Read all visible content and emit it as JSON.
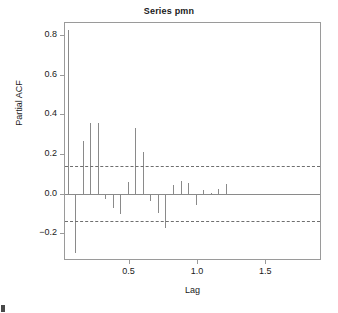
{
  "chart_data": {
    "type": "bar",
    "title": "Series pmn",
    "subtitle": "",
    "xlabel": "Lag",
    "ylabel": "Partial ACF",
    "xlim": [
      0.035,
      1.9
    ],
    "ylim": [
      -0.33,
      0.86
    ],
    "xticks": [
      0.5,
      1.0,
      1.5
    ],
    "xtick_labels": [
      "0.5",
      "1.0",
      "1.5"
    ],
    "yticks": [
      0.8,
      0.6,
      0.4,
      0.2,
      0.0,
      -0.2
    ],
    "ytick_labels": [
      "0.8",
      "0.6",
      "0.4",
      "0.2",
      "0.0",
      "−0.2"
    ],
    "grid": false,
    "legend": null,
    "confidence_band": [
      0.14,
      -0.14
    ],
    "confidence_style": "dashed",
    "x": [
      0.055,
      0.11,
      0.165,
      0.22,
      0.275,
      0.33,
      0.385,
      0.44,
      0.495,
      0.55,
      0.605,
      0.66,
      0.715,
      0.77,
      0.825,
      0.88,
      0.935,
      0.99,
      1.045,
      1.1,
      1.155,
      1.21,
      1.265,
      1.32,
      1.375,
      1.43,
      1.485,
      1.54,
      1.595,
      1.65,
      1.705,
      1.76,
      1.815,
      1.87
    ],
    "values": [
      0.825,
      -0.3,
      0.265,
      0.355,
      0.355,
      -0.03,
      -0.075,
      -0.105,
      0.06,
      0.33,
      0.21,
      -0.04,
      -0.1,
      -0.175,
      0.045,
      0.065,
      0.055,
      -0.06,
      0.02,
      0.005,
      0.025,
      0.05,
      0.0,
      0.0,
      0.0,
      0.0,
      0.0,
      0.0,
      0.0,
      0.0,
      0.0,
      0.0,
      0.0,
      0.0
    ],
    "series_note": "partial autocorrelation spikes"
  },
  "axes": {
    "title": "Series pmn",
    "x_title": "Lag",
    "y_title": "Partial ACF"
  }
}
